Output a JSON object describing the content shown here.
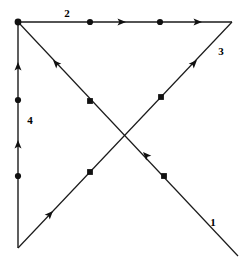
{
  "figure": {
    "background_color": "#ffffff",
    "stroke_color": "#1a1a1a",
    "marker_color": "#111111",
    "label_color": "#000000",
    "width": 248,
    "height": 259
  },
  "vertices": [
    {
      "id": "A",
      "name": "top-left-vertex",
      "x": 18,
      "y": 22,
      "marker": "round-dot"
    },
    {
      "id": "B",
      "name": "top-right-vertex",
      "x": 232,
      "y": 22,
      "marker": "none"
    },
    {
      "id": "C",
      "name": "bottom-left-vertex",
      "x": 18,
      "y": 248,
      "marker": "none"
    },
    {
      "id": "D",
      "name": "bottom-right-vertex",
      "x": 238,
      "y": 256,
      "marker": "none"
    }
  ],
  "edges": [
    {
      "id": "edge-2",
      "name": "top-edge",
      "label": "2",
      "label_x": 67,
      "label_y": 17,
      "from": "A",
      "to": "B",
      "path": "M 18 22 L 232 22",
      "direction": "left-to-right",
      "dots": [
        {
          "shape": "round",
          "x": 90,
          "y": 22
        },
        {
          "shape": "round",
          "x": 160,
          "y": 22
        }
      ],
      "arrows": [
        {
          "x": 126,
          "y": 22,
          "angle": 0
        },
        {
          "x": 202,
          "y": 22,
          "angle": 0
        }
      ]
    },
    {
      "id": "edge-4",
      "name": "left-vertical-edge",
      "label": "4",
      "label_x": 30,
      "label_y": 124,
      "from": "C",
      "to": "A",
      "path": "M 18 248 L 18 22",
      "direction": "bottom-to-top",
      "dots": [
        {
          "shape": "round",
          "x": 18,
          "y": 100
        },
        {
          "shape": "round",
          "x": 18,
          "y": 176
        }
      ],
      "arrows": [
        {
          "x": 18,
          "y": 62,
          "angle": -90
        },
        {
          "x": 18,
          "y": 140,
          "angle": -90
        }
      ]
    },
    {
      "id": "edge-1",
      "name": "diagonal-bottom-right-to-top-left",
      "label": "1",
      "label_x": 213,
      "label_y": 226,
      "from": "D",
      "to": "A",
      "path": "M 238 256 L 18 22",
      "direction": "bottom-right-to-top-left",
      "dots": [
        {
          "shape": "square",
          "x": 90,
          "y": 101
        },
        {
          "shape": "square",
          "x": 164,
          "y": 176
        }
      ],
      "arrows": [
        {
          "x": 53,
          "y": 60,
          "angle": -133
        },
        {
          "x": 143,
          "y": 152,
          "angle": -133
        }
      ]
    },
    {
      "id": "edge-3",
      "name": "diagonal-bottom-left-to-top-right",
      "label": "3",
      "label_x": 221,
      "label_y": 55,
      "from": "C",
      "to": "B",
      "path": "M 18 248 L 232 22",
      "direction": "bottom-left-to-top-right",
      "dots": [
        {
          "shape": "square",
          "x": 90,
          "y": 172
        },
        {
          "shape": "square",
          "x": 161,
          "y": 97
        }
      ],
      "arrows": [
        {
          "x": 53,
          "y": 211,
          "angle": -47
        },
        {
          "x": 197,
          "y": 60,
          "angle": -47
        }
      ]
    }
  ]
}
